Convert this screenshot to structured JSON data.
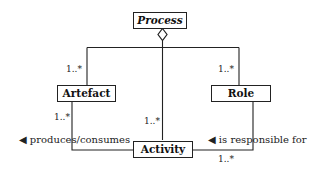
{
  "diagram": {
    "type": "UML class diagram",
    "classes": {
      "process": {
        "name": "Process",
        "italic": true
      },
      "artefact": {
        "name": "Artefact"
      },
      "role": {
        "name": "Role"
      },
      "activity": {
        "name": "Activity"
      }
    },
    "relations": [
      {
        "id": "process-aggregation",
        "kind": "aggregation",
        "from": "Process",
        "to": [
          "Artefact",
          "Activity",
          "Role"
        ]
      },
      {
        "id": "artefact-activity",
        "label": "produces/consumes",
        "direction_arrow": "◀",
        "multiplicity_artefact_end": "1..*"
      },
      {
        "id": "role-activity",
        "label": "is responsible for",
        "direction_arrow": "◀",
        "multiplicity_activity_end": "1..*"
      }
    ],
    "multiplicities": {
      "artefact_top": "1..*",
      "activity_top": "1..*",
      "role_top": "1..*",
      "artefact_bottom": "1..*",
      "role_activity_bottom": "1..*"
    },
    "labels": {
      "produces_consumes": "◀ produces/consumes",
      "is_responsible_for": "◀ is responsible for"
    }
  }
}
